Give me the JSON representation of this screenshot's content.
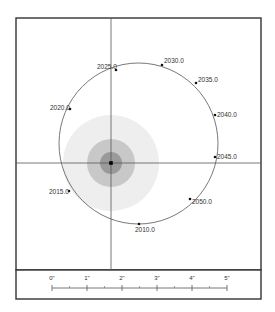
{
  "diagram": {
    "type": "orbit-plot",
    "frame": {
      "x": 16,
      "y": 18,
      "width": 245,
      "height": 252
    },
    "scale_panel": {
      "x": 16,
      "y": 270,
      "width": 245,
      "height": 29
    },
    "crosshair": {
      "x": 111,
      "y": 163
    },
    "primary": {
      "cx": 111,
      "cy": 163,
      "rings": [
        {
          "r": 48,
          "color": "#eeeeee"
        },
        {
          "r": 24,
          "color": "#c8c8c8"
        },
        {
          "r": 11,
          "color": "#9a9a9a"
        }
      ],
      "dot_color": "#000000"
    },
    "orbit": {
      "cx": 138.5,
      "cy": 143.5,
      "rx": 79.5,
      "ry": 80.5,
      "color": "#555555"
    },
    "epochs": [
      {
        "label": "2010.0",
        "x": 139,
        "y": 224,
        "lx": 135,
        "ly": 232,
        "anchor": "start"
      },
      {
        "label": "2015.0",
        "x": 69,
        "y": 191,
        "lx": 49,
        "ly": 194,
        "anchor": "start"
      },
      {
        "label": "2020.0",
        "x": 70,
        "y": 109,
        "lx": 50,
        "ly": 110,
        "anchor": "start"
      },
      {
        "label": "2025.0",
        "x": 116,
        "y": 70,
        "lx": 97,
        "ly": 69,
        "anchor": "start"
      },
      {
        "label": "2030.0",
        "x": 162,
        "y": 65,
        "lx": 164,
        "ly": 63,
        "anchor": "start"
      },
      {
        "label": "2035.0",
        "x": 196,
        "y": 83,
        "lx": 198,
        "ly": 82,
        "anchor": "start"
      },
      {
        "label": "2040.0",
        "x": 215,
        "y": 115,
        "lx": 217,
        "ly": 117,
        "anchor": "start"
      },
      {
        "label": "2045.0",
        "x": 215,
        "y": 157,
        "lx": 217,
        "ly": 159,
        "anchor": "start"
      },
      {
        "label": "2050.0",
        "x": 190,
        "y": 199,
        "lx": 192,
        "ly": 204,
        "anchor": "start"
      }
    ],
    "scale": {
      "y": 288,
      "ticks": [
        {
          "label": "0\"",
          "x": 52
        },
        {
          "label": "1\"",
          "x": 87
        },
        {
          "label": "2\"",
          "x": 122
        },
        {
          "label": "3\"",
          "x": 157
        },
        {
          "label": "4\"",
          "x": 192
        },
        {
          "label": "5\"",
          "x": 227
        }
      ],
      "minor_ticks": [
        69.5,
        104.5,
        139.5,
        174.5,
        209.5
      ]
    }
  }
}
